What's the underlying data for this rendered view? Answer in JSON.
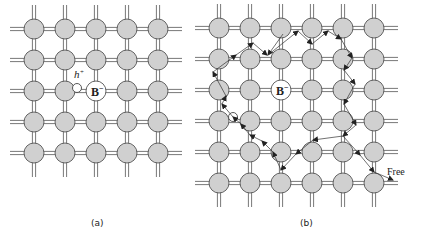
{
  "figure": {
    "panels": [
      {
        "id": "a",
        "caption": "(a)",
        "grid": {
          "cols": [
            34,
            65,
            96,
            127,
            158
          ],
          "rows": [
            29,
            60,
            91,
            122,
            153
          ],
          "radius": 10
        },
        "dopant": {
          "label": "B",
          "superscript": "−",
          "col": 2,
          "row": 2
        },
        "hole": {
          "label": "h",
          "superscript": "+",
          "x": 77,
          "y": 88
        }
      },
      {
        "id": "b",
        "caption": "(b)",
        "grid": {
          "cols": [
            219,
            250,
            281,
            312,
            343,
            374
          ],
          "rows": [
            28,
            59,
            90,
            121,
            152,
            183
          ],
          "radius": 10
        },
        "dopant": {
          "label": "B",
          "superscript": "−",
          "col": 2,
          "row": 2
        },
        "hole": {
          "x": 233,
          "y": 117
        },
        "path_label": "Free",
        "path_points": [
          [
            283,
            34
          ],
          [
            268,
            55
          ],
          [
            298,
            31
          ],
          [
            312,
            44
          ],
          [
            328,
            31
          ],
          [
            341,
            39
          ],
          [
            352,
            58
          ],
          [
            344,
            70
          ],
          [
            355,
            84
          ],
          [
            344,
            104
          ],
          [
            356,
            125
          ],
          [
            343,
            136
          ],
          [
            313,
            140
          ],
          [
            296,
            154
          ],
          [
            281,
            170
          ],
          [
            273,
            152
          ],
          [
            262,
            141
          ],
          [
            250,
            135
          ],
          [
            241,
            124
          ],
          [
            233,
            117
          ],
          [
            222,
            104
          ],
          [
            226,
            96
          ],
          [
            213,
            72
          ],
          [
            236,
            55
          ],
          [
            253,
            43
          ],
          [
            267,
            55
          ]
        ],
        "free_path": [
          [
            343,
            136
          ],
          [
            360,
            155
          ],
          [
            374,
            172
          ],
          [
            393,
            180
          ]
        ]
      }
    ]
  }
}
